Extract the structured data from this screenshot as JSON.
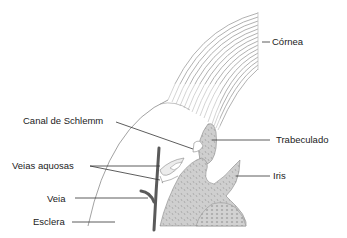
{
  "diagram": {
    "type": "anatomical-cross-section",
    "labels": {
      "cornea": "Córnea",
      "schlemm": "Canal de Schlemm",
      "trabecular": "Trabeculado",
      "aqueous_veins": "Veias aquosas",
      "iris": "Iris",
      "vein": "Veia",
      "sclera": "Esclera"
    },
    "colors": {
      "tissue_fill": "#c8c8c8",
      "cornea_lines": "#9a9a9a",
      "vein": "#555555",
      "leader_line": "#333333",
      "outline": "#888888"
    }
  }
}
